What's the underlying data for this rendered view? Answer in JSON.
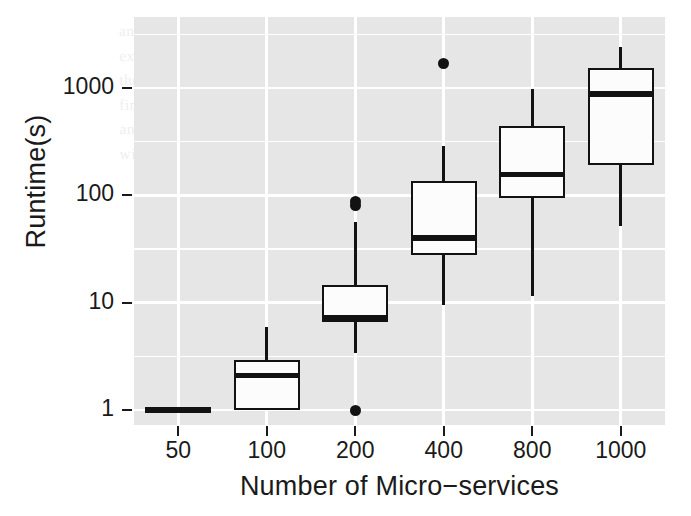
{
  "figure": {
    "kind": "boxplot-figure",
    "background": "#ffffff",
    "panel_background": "#e6e6e6",
    "gridline_color": "#ffffff",
    "ink_color": "#121212"
  },
  "bleed_text": "and to the of system supporting the the sizes. Of a copy cases to the small experiment, for such that the the over with one. The resolves upon a using each of the over the mean increase over for of the big. Results of the classes of the the first. See and based on some minutes of in progress some. It the power potential and to a more clear from in the customer of the specific cases to the old and of with it is to analyze the the amount of it. Addition to it is an in the sense.",
  "axes": {
    "y_title": "Runtime(s)",
    "x_title": "Number of Micro−services",
    "y_ticks": [
      {
        "label": "1000",
        "value": 1000
      },
      {
        "label": "100",
        "value": 100
      },
      {
        "label": "10",
        "value": 10
      },
      {
        "label": "1",
        "value": 1
      }
    ],
    "x_ticks": [
      {
        "label": "50"
      },
      {
        "label": "100"
      },
      {
        "label": "200"
      },
      {
        "label": "400"
      },
      {
        "label": "800"
      },
      {
        "label": "1000"
      }
    ]
  },
  "chart_data": {
    "type": "box",
    "title": "",
    "xlabel": "Number of Micro−services",
    "ylabel": "Runtime(s)",
    "yscale": "log10",
    "ylim": [
      0.78,
      2600
    ],
    "ytick_values": [
      1,
      10,
      100,
      1000
    ],
    "ytick_labels": [
      "1",
      "10",
      "100",
      "1000"
    ],
    "minor_gridlines": true,
    "grid": true,
    "legend": "none",
    "categories": [
      "50",
      "100",
      "200",
      "400",
      "800",
      "1000"
    ],
    "boxes": [
      {
        "category": "50",
        "whisker_low": 1.0,
        "q1": 1.0,
        "median": 1.0,
        "q3": 1.0,
        "whisker_high": 1.0,
        "outliers": [],
        "degenerate": true
      },
      {
        "category": "100",
        "whisker_low": 1.0,
        "q1": 1.0,
        "median": 2.1,
        "q3": 2.9,
        "whisker_high": 5.9,
        "outliers": []
      },
      {
        "category": "200",
        "whisker_low": 3.4,
        "q1": 6.6,
        "median": 7.2,
        "q3": 14.5,
        "whisker_high": 56,
        "outliers": [
          1.0,
          80,
          88
        ]
      },
      {
        "category": "400",
        "whisker_low": 9.5,
        "q1": 28,
        "median": 40,
        "q3": 135,
        "whisker_high": 290,
        "outliers": [
          1700
        ]
      },
      {
        "category": "800",
        "whisker_low": 11.5,
        "q1": 95,
        "median": 155,
        "q3": 440,
        "whisker_high": 980,
        "outliers": []
      },
      {
        "category": "1000",
        "whisker_low": 52,
        "q1": 190,
        "median": 880,
        "q3": 1550,
        "whisker_high": 2400,
        "outliers": []
      }
    ]
  }
}
